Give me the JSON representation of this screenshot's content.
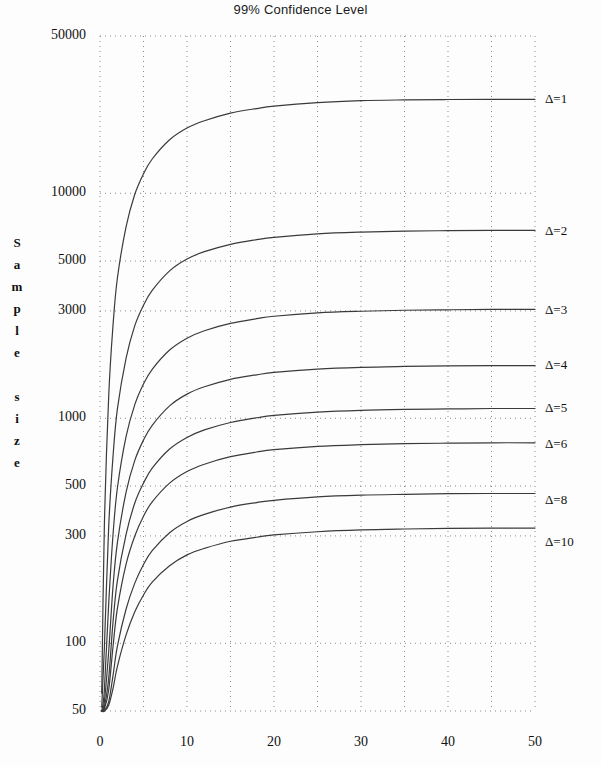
{
  "title": "99% Confidence Level",
  "axis_title_y": "S\na\nm\np\nl\ne\n\ns\ni\nz\ne",
  "chart_data": {
    "type": "line",
    "title": "99% Confidence Level",
    "xlabel": "",
    "ylabel": "Sample size",
    "yscale": "log",
    "xlim": [
      0,
      50
    ],
    "ylim": [
      50,
      50000
    ],
    "grid": true,
    "legend_position": "right-inline",
    "x_ticks": [
      0,
      10,
      20,
      30,
      40,
      50
    ],
    "x_tick_labels": [
      "0",
      "10",
      "20",
      "30",
      "40",
      "50"
    ],
    "x_gridlines": [
      0,
      5,
      10,
      15,
      20,
      25,
      30,
      35,
      40,
      45,
      50
    ],
    "y_ticks": [
      50,
      100,
      300,
      500,
      1000,
      3000,
      5000,
      10000,
      50000
    ],
    "y_tick_labels": [
      "50",
      "100",
      "300",
      "500",
      "1000",
      "3000",
      "5000",
      "10000",
      "50000"
    ],
    "y_gridlines": [
      50,
      100,
      300,
      500,
      1000,
      3000,
      5000,
      10000,
      50000
    ],
    "series": [
      {
        "name": "Δ=1",
        "label": "Δ=1",
        "label_y_value": 26000,
        "asymptote": 26000,
        "x": [
          0.2,
          0.5,
          1,
          1.5,
          2,
          3,
          4,
          5,
          6,
          8,
          10,
          12,
          15,
          18,
          20,
          25,
          30,
          35,
          40,
          45,
          50
        ],
        "y": [
          60,
          330,
          1250,
          2600,
          4200,
          7100,
          9900,
          12200,
          14200,
          17300,
          19500,
          21000,
          22700,
          23800,
          24400,
          25300,
          25800,
          26000,
          26100,
          26150,
          26150
        ]
      },
      {
        "name": "Δ=2",
        "label": "Δ=2",
        "label_y_value": 6700,
        "asymptote": 6700,
        "x": [
          0.2,
          0.5,
          1,
          1.5,
          2,
          3,
          4,
          5,
          6,
          8,
          10,
          12,
          15,
          18,
          20,
          25,
          30,
          35,
          40,
          45,
          50
        ],
        "y": [
          52,
          95,
          330,
          680,
          1100,
          1850,
          2580,
          3180,
          3700,
          4520,
          5100,
          5500,
          5930,
          6220,
          6370,
          6600,
          6720,
          6790,
          6820,
          6840,
          6840
        ]
      },
      {
        "name": "Δ=3",
        "label": "Δ=3",
        "label_y_value": 3000,
        "asymptote": 2980,
        "x": [
          0.2,
          0.5,
          1,
          1.5,
          2,
          3,
          4,
          5,
          6,
          8,
          10,
          12,
          15,
          18,
          20,
          25,
          30,
          35,
          40,
          45,
          50
        ],
        "y": [
          50,
          62,
          150,
          305,
          490,
          830,
          1150,
          1420,
          1650,
          2010,
          2270,
          2450,
          2640,
          2770,
          2840,
          2940,
          2990,
          3020,
          3035,
          3045,
          3045
        ]
      },
      {
        "name": "Δ=4",
        "label": "Δ=4",
        "label_y_value": 1700,
        "asymptote": 1690,
        "x": [
          0.2,
          0.5,
          1,
          1.5,
          2,
          3,
          4,
          5,
          6,
          8,
          10,
          12,
          15,
          18,
          20,
          25,
          30,
          35,
          40,
          45,
          50
        ],
        "y": [
          50,
          55,
          92,
          180,
          280,
          470,
          650,
          800,
          930,
          1135,
          1280,
          1380,
          1490,
          1560,
          1600,
          1655,
          1685,
          1700,
          1710,
          1715,
          1715
        ]
      },
      {
        "name": "Δ=5",
        "label": "Δ=5",
        "label_y_value": 1100,
        "asymptote": 1090,
        "x": [
          0.2,
          0.5,
          1,
          1.5,
          2,
          3,
          4,
          5,
          6,
          8,
          10,
          12,
          15,
          18,
          20,
          25,
          30,
          35,
          40,
          45,
          50
        ],
        "y": [
          50,
          52,
          70,
          125,
          190,
          305,
          420,
          515,
          600,
          730,
          822,
          888,
          958,
          1005,
          1030,
          1065,
          1085,
          1095,
          1100,
          1105,
          1105
        ]
      },
      {
        "name": "Δ=6",
        "label": "Δ=6",
        "label_y_value": 760,
        "asymptote": 755,
        "x": [
          0.2,
          0.5,
          1,
          1.5,
          2,
          3,
          4,
          5,
          6,
          8,
          10,
          12,
          15,
          18,
          20,
          25,
          30,
          35,
          40,
          45,
          50
        ],
        "y": [
          50,
          51,
          62,
          97,
          143,
          225,
          300,
          367,
          425,
          515,
          580,
          625,
          675,
          708,
          725,
          750,
          763,
          771,
          775,
          778,
          778
        ]
      },
      {
        "name": "Δ=8",
        "label": "Δ=8",
        "label_y_value": 430,
        "asymptote": 427,
        "x": [
          0.2,
          0.5,
          1,
          1.5,
          2,
          3,
          4,
          5,
          6,
          8,
          10,
          12,
          15,
          18,
          20,
          25,
          30,
          35,
          40,
          45,
          50
        ],
        "y": [
          50,
          50,
          55,
          72,
          97,
          142,
          185,
          224,
          258,
          310,
          348,
          374,
          403,
          422,
          432,
          447,
          455,
          459,
          462,
          463,
          463
        ]
      },
      {
        "name": "Δ=10",
        "label": "Δ=10",
        "label_y_value": 280,
        "asymptote": 278,
        "x": [
          0.2,
          0.5,
          1,
          1.5,
          2,
          3,
          4,
          5,
          6,
          8,
          10,
          12,
          15,
          18,
          20,
          25,
          30,
          35,
          40,
          45,
          50
        ],
        "y": [
          50,
          50,
          53,
          63,
          79,
          109,
          138,
          164,
          187,
          221,
          247,
          264,
          284,
          296,
          303,
          313,
          319,
          322,
          324,
          325,
          325
        ]
      }
    ]
  },
  "colors": {
    "line": "#3a3a3a",
    "grid": "#8a8a8a",
    "text": "#111111",
    "background": "#fdfdfd"
  }
}
